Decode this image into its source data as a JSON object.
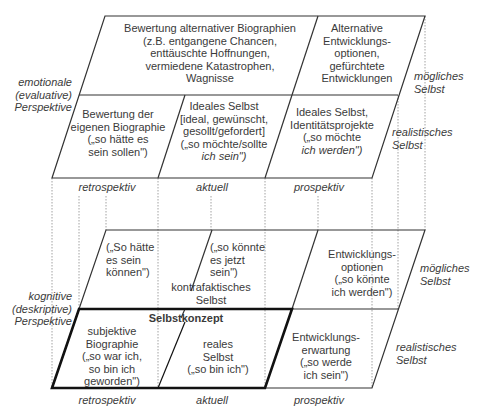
{
  "emotional": {
    "side_label": [
      "emotionale",
      "(evaluative)",
      "Perspektive"
    ],
    "top_row": {
      "left_cell": [
        "Bewertung alternativer Biographien",
        "(z.B. entgangene Chancen,",
        "enttäuschte Hoffnungen,",
        "vermiedene Katastrophen,",
        "Wagnisse"
      ],
      "right_cell": [
        "Alternative",
        "Entwicklungs-",
        "optionen,",
        "gefürchtete",
        "Entwicklungen"
      ]
    },
    "bottom_row": {
      "retro_cell": [
        "Bewertung der",
        "eigenen Biographie",
        "(„so hätte es",
        "sein sollen\")"
      ],
      "actual_cell": [
        "Ideales Selbst",
        "[ideal, gewünscht,",
        "gesollt/gefordert]",
        "(„so möchte/sollte",
        "ich sein\")"
      ],
      "prosp_cell": [
        "Ideales Selbst,",
        "Identitätsprojekte",
        "(„so möchte",
        "ich werden\")"
      ]
    },
    "right_labels": {
      "possible": [
        "mögliches",
        "Selbst"
      ],
      "realistic": [
        "realistisches",
        "Selbst"
      ]
    }
  },
  "cognitive": {
    "side_label": [
      "kognitive",
      "(deskriptive)",
      "Perspektive"
    ],
    "top_row": {
      "retro_cell": [
        "(„So hätte",
        "es sein",
        "können\")"
      ],
      "actual_cell": [
        "(„so könnte",
        "es jetzt",
        "sein\")"
      ],
      "counterfactual_label": [
        "kontrafaktisches",
        "Selbst"
      ],
      "prosp_cell": [
        "Entwicklungs-",
        "optionen",
        "(„so könnte",
        "ich werden\")"
      ]
    },
    "bottom_row": {
      "concept_title": "Selbstkonzept",
      "retro_cell": [
        "subjektive",
        "Biographie",
        "(„so war ich,",
        "so bin ich",
        "geworden\")"
      ],
      "actual_cell": [
        "reales",
        "Selbst",
        "(„so bin ich\")"
      ],
      "prosp_cell": [
        "Entwicklungs-",
        "erwartung",
        "(„so werde",
        "ich sein\")"
      ]
    },
    "right_labels": {
      "possible": [
        "mögliches",
        "Selbst"
      ],
      "realistic": [
        "realistisches",
        "Selbst"
      ]
    }
  },
  "time_axis": {
    "upper": [
      "retrospektiv",
      "aktuell",
      "prospektiv"
    ],
    "lower": [
      "retrospektiv",
      "aktuell",
      "prospektiv"
    ]
  },
  "colors": {
    "line": "#333333",
    "thick_line": "#111111",
    "dotted": "#888888",
    "text": "#3a3a3a"
  }
}
